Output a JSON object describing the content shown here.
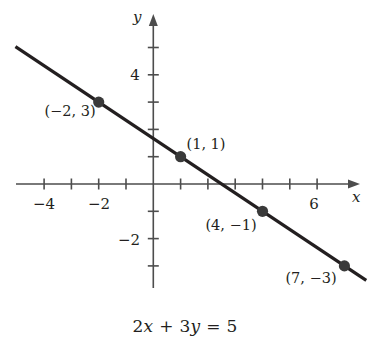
{
  "figure": {
    "caption": "2x + 3y = 5",
    "caption_parts": {
      "coef_x": "2",
      "var_x": "x",
      "plus": "+",
      "coef_y": "3",
      "var_y": "y",
      "equals": "=",
      "constant": "5"
    },
    "line_color": "#231f20",
    "axis_color": "#4d4d4d",
    "point_color": "#3a3a3a",
    "background": "#ffffff"
  },
  "axes": {
    "x_axis_label": "x",
    "y_axis_label": "y",
    "x_tick_labels": [
      {
        "value": -4,
        "text": "−4"
      },
      {
        "value": -2,
        "text": "−2"
      },
      {
        "value": 6,
        "text": "6"
      }
    ],
    "y_tick_labels": [
      {
        "value": 4,
        "text": "4"
      },
      {
        "value": -2,
        "text": "−2"
      }
    ]
  },
  "chart_data": {
    "type": "line",
    "title": "",
    "subtitle": "",
    "xlabel": "x",
    "ylabel": "y",
    "equation": "2x + 3y = 5",
    "slope": -0.6667,
    "y_intercept": 1.6667,
    "x_intercept": 2.5,
    "xlim": [
      -5.05,
      7.8
    ],
    "ylim": [
      -4.0,
      5.6
    ],
    "grid": false,
    "legend": "none",
    "x_ticks": [
      -5,
      -4,
      -3,
      -2,
      -1,
      1,
      2,
      3,
      4,
      5,
      6,
      7
    ],
    "y_ticks": [
      -3,
      -2,
      -1,
      1,
      2,
      3,
      4,
      5
    ],
    "x_tick_labels_shown": [
      "−4",
      "−2",
      "6"
    ],
    "y_tick_labels_shown": [
      "4",
      "−2"
    ],
    "series": [
      {
        "name": "2x + 3y = 5",
        "type": "line",
        "x": [
          -5.05,
          7.8
        ],
        "y": [
          5.03,
          -3.53
        ]
      }
    ],
    "points": [
      {
        "x": -2,
        "y": 3,
        "label": "(−2, 3)"
      },
      {
        "x": 1,
        "y": 1,
        "label": "(1, 1)"
      },
      {
        "x": 4,
        "y": -1,
        "label": "(4, −1)"
      },
      {
        "x": 7,
        "y": -3,
        "label": "(7, −3)"
      }
    ]
  }
}
